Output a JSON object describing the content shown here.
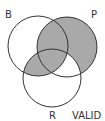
{
  "diagram": {
    "type": "venn",
    "labels": {
      "b": "B",
      "p": "P",
      "r": "R",
      "verdict": "VALID"
    },
    "circles": [
      {
        "name": "B",
        "cx": 38,
        "cy": 46,
        "r": 30
      },
      {
        "name": "P",
        "cx": 67,
        "cy": 47,
        "r": 30
      },
      {
        "name": "R",
        "cx": 52,
        "cy": 78,
        "r": 29
      }
    ],
    "shaded_regions": [
      "P only",
      "B and P not R",
      "B and P and R",
      "B and R not P"
    ],
    "unshaded_regions": [
      "B only",
      "R only",
      "P and R not B"
    ],
    "colors": {
      "shade": "#a9a9a9",
      "stroke": "#333333",
      "background": "#ffffff"
    }
  }
}
